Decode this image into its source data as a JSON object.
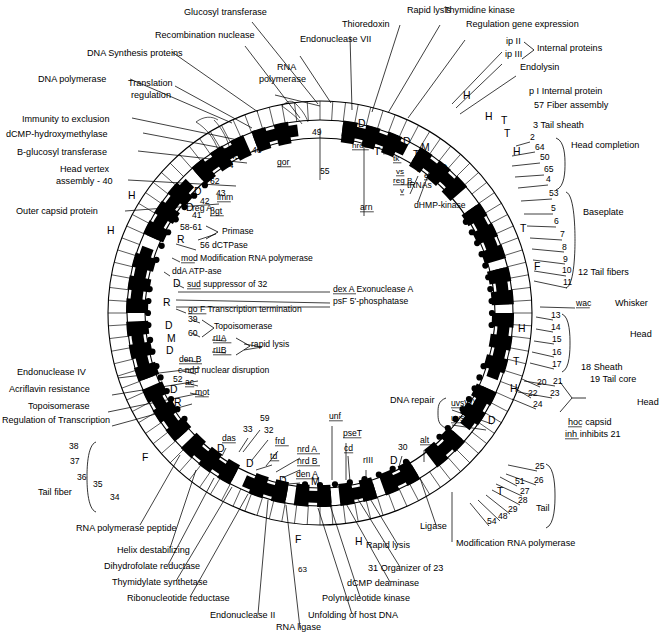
{
  "figure": {
    "type": "circular-genetic-map",
    "background": "#ffffff",
    "ink": "#000000"
  },
  "outer_labels_left": [
    {
      "text": "DNA polymerase",
      "x": 38,
      "y": 82
    },
    {
      "text": "Immunity to exclusion",
      "x": 22,
      "y": 122
    },
    {
      "text": "dCMP-hydroxymethylase",
      "x": 6,
      "y": 137
    },
    {
      "text": "B-glucosyl transferase",
      "x": 17,
      "y": 155
    },
    {
      "text": "Head vertex",
      "x": 60,
      "y": 172
    },
    {
      "text": "assembly - 40",
      "x": 56,
      "y": 184
    },
    {
      "text": "Outer capsid protein",
      "x": 16,
      "y": 214
    },
    {
      "text": "Endonuclease IV",
      "x": 17,
      "y": 375
    },
    {
      "text": "Acriflavin resistance",
      "x": 9,
      "y": 392
    },
    {
      "text": "Topoisomerase",
      "x": 28,
      "y": 409
    },
    {
      "text": "Regulation of Transcription",
      "x": 2,
      "y": 423
    },
    {
      "text": "Tail fiber",
      "x": 38,
      "y": 495
    },
    {
      "text": "RNA polymerase peptide",
      "x": 76,
      "y": 531
    },
    {
      "text": "Helix destabilizing",
      "x": 117,
      "y": 553
    },
    {
      "text": "Dihydrofolate reductase",
      "x": 104,
      "y": 569
    },
    {
      "text": "Thymidylate synthetase",
      "x": 112,
      "y": 585
    },
    {
      "text": "Ribonucleotide reductase",
      "x": 127,
      "y": 601
    },
    {
      "text": "Endonuclease II",
      "x": 210,
      "y": 618
    },
    {
      "text": "RNA ligase",
      "x": 276,
      "y": 630
    },
    {
      "text": "Unfolding of host DNA",
      "x": 308,
      "y": 618
    },
    {
      "text": "Polynucleotide kinase",
      "x": 322,
      "y": 601
    },
    {
      "text": "dCMP deaminase",
      "x": 347,
      "y": 586
    },
    {
      "text": "31 Organizer of 23",
      "x": 368,
      "y": 571
    },
    {
      "text": "Rapid lysis",
      "x": 366,
      "y": 548
    },
    {
      "text": "Ligase",
      "x": 420,
      "y": 529
    },
    {
      "text": "Modification RNA polymerase",
      "x": 456,
      "y": 546
    }
  ],
  "outer_labels_top": [
    {
      "text": "Translation",
      "x": 128,
      "y": 86
    },
    {
      "text": "regulation",
      "x": 131,
      "y": 98
    },
    {
      "text": "DNA  Synthesis  proteins",
      "x": 87,
      "y": 56
    },
    {
      "text": "Recombination nuclease",
      "x": 155,
      "y": 38
    },
    {
      "text": "Glucosyl transferase",
      "x": 184,
      "y": 15
    },
    {
      "text": "Endonuclease VII",
      "x": 300,
      "y": 42
    },
    {
      "text": "RNA",
      "x": 277,
      "y": 70
    },
    {
      "text": "polymerase",
      "x": 259,
      "y": 82
    },
    {
      "text": "Thioredoxin",
      "x": 342,
      "y": 27
    },
    {
      "text": "Rapid lysis",
      "x": 407,
      "y": 13
    },
    {
      "text": "Thymidine kinase",
      "x": 444,
      "y": 13
    },
    {
      "text": "Regulation gene expression",
      "x": 466,
      "y": 27
    },
    {
      "text": "ip II",
      "x": 506,
      "y": 44
    },
    {
      "text": "ip III",
      "x": 505,
      "y": 57
    },
    {
      "text": "Internal proteins",
      "x": 537,
      "y": 51
    },
    {
      "text": "Endolysin",
      "x": 520,
      "y": 70
    },
    {
      "text": "p I   Internal protein",
      "x": 529,
      "y": 94
    },
    {
      "text": "57  Fiber assembly",
      "x": 534,
      "y": 108
    },
    {
      "text": "3  Tail sheath",
      "x": 533,
      "y": 128
    },
    {
      "text": "Head completion",
      "x": 571,
      "y": 148
    },
    {
      "text": "Baseplate",
      "x": 583,
      "y": 215
    },
    {
      "text": "12  Tail fibers",
      "x": 578,
      "y": 275
    },
    {
      "text": "Whisker",
      "x": 615,
      "y": 306
    },
    {
      "text": "Head",
      "x": 630,
      "y": 337
    },
    {
      "text": "18 Sheath",
      "x": 581,
      "y": 370
    },
    {
      "text": "19 Tail core",
      "x": 590,
      "y": 382
    },
    {
      "text": "Head",
      "x": 637,
      "y": 405
    },
    {
      "text": "hoc   capsid",
      "x": 568,
      "y": 425
    },
    {
      "text": "inh   inhibits 21",
      "x": 565,
      "y": 437
    },
    {
      "text": "Tail",
      "x": 536,
      "y": 511
    },
    {
      "text": "DNA repair",
      "x": 390,
      "y": 403
    }
  ],
  "inner_labels": [
    {
      "text": "reg A",
      "x": 192,
      "y": 211
    },
    {
      "text": "gor",
      "x": 277,
      "y": 165
    },
    {
      "text": "55",
      "x": 320,
      "y": 174
    },
    {
      "text": "arn",
      "x": 360,
      "y": 210
    },
    {
      "text": "dHMP-kinase",
      "x": 414,
      "y": 208
    },
    {
      "text": "tRNAs",
      "x": 407,
      "y": 188
    },
    {
      "text": "49",
      "x": 312,
      "y": 135
    },
    {
      "text": "46",
      "x": 252,
      "y": 153
    },
    {
      "text": "45",
      "x": 230,
      "y": 159
    },
    {
      "text": "44",
      "x": 224,
      "y": 168
    },
    {
      "text": "62",
      "x": 210,
      "y": 184
    },
    {
      "text": "43",
      "x": 216,
      "y": 196
    },
    {
      "text": "42",
      "x": 200,
      "y": 204
    },
    {
      "text": "41",
      "x": 192,
      "y": 218
    },
    {
      "text": "58-61",
      "x": 180,
      "y": 230
    },
    {
      "text": "imm",
      "x": 217,
      "y": 200
    },
    {
      "text": "βgt",
      "x": 210,
      "y": 214
    },
    {
      "text": "Primase",
      "x": 222,
      "y": 234
    },
    {
      "text": "56 dCTPase",
      "x": 200,
      "y": 248
    },
    {
      "text": "mod Modification RNA polymerase",
      "x": 181,
      "y": 261
    },
    {
      "text": "ddA ATP-ase",
      "x": 172,
      "y": 274
    },
    {
      "text": "sud  suppressor of 32",
      "x": 187,
      "y": 287
    },
    {
      "text": "dex A  Exonuclease A",
      "x": 333,
      "y": 292
    },
    {
      "text": "psF 5'-phosphatase",
      "x": 333,
      "y": 304
    },
    {
      "text": "go F Transcription termination",
      "x": 188,
      "y": 312
    },
    {
      "text": "39",
      "x": 188,
      "y": 322
    },
    {
      "text": "60",
      "x": 188,
      "y": 336
    },
    {
      "text": "Topoisomerase",
      "x": 214,
      "y": 329
    },
    {
      "text": "rIIA",
      "x": 213,
      "y": 341
    },
    {
      "text": "rIIB",
      "x": 213,
      "y": 353
    },
    {
      "text": "rapid lysis",
      "x": 251,
      "y": 347
    },
    {
      "text": "den B",
      "x": 179,
      "y": 362
    },
    {
      "text": "c  ndd  nuclear disruption",
      "x": 178,
      "y": 373
    },
    {
      "text": "ac",
      "x": 185,
      "y": 385
    },
    {
      "text": "52",
      "x": 173,
      "y": 382
    },
    {
      "text": "mot",
      "x": 195,
      "y": 395
    },
    {
      "text": "uvsW)",
      "x": 451,
      "y": 406
    },
    {
      "text": "uvsY)",
      "x": 451,
      "y": 421
    },
    {
      "text": "59",
      "x": 260,
      "y": 421
    },
    {
      "text": "33",
      "x": 243,
      "y": 432
    },
    {
      "text": "32",
      "x": 264,
      "y": 433
    },
    {
      "text": "das",
      "x": 222,
      "y": 441
    },
    {
      "text": "frd",
      "x": 275,
      "y": 444
    },
    {
      "text": "td",
      "x": 270,
      "y": 459
    },
    {
      "text": "nrd A",
      "x": 297,
      "y": 452
    },
    {
      "text": "nrd B",
      "x": 297,
      "y": 464
    },
    {
      "text": "den A",
      "x": 296,
      "y": 477
    },
    {
      "text": "unf",
      "x": 329,
      "y": 419
    },
    {
      "text": "pseT",
      "x": 343,
      "y": 436
    },
    {
      "text": "cd",
      "x": 344,
      "y": 451
    },
    {
      "text": "rIII",
      "x": 363,
      "y": 463
    },
    {
      "text": "30",
      "x": 398,
      "y": 450
    },
    {
      "text": "alt",
      "x": 420,
      "y": 443
    },
    {
      "text": "38",
      "x": 69,
      "y": 449
    },
    {
      "text": "37",
      "x": 70,
      "y": 464
    },
    {
      "text": "36",
      "x": 77,
      "y": 480
    },
    {
      "text": "35",
      "x": 93,
      "y": 487
    },
    {
      "text": "34",
      "x": 110,
      "y": 500
    },
    {
      "text": "2",
      "x": 530,
      "y": 140
    },
    {
      "text": "64",
      "x": 535,
      "y": 150
    },
    {
      "text": "50",
      "x": 540,
      "y": 160
    },
    {
      "text": "65",
      "x": 544,
      "y": 172
    },
    {
      "text": "4",
      "x": 546,
      "y": 182
    },
    {
      "text": "53",
      "x": 549,
      "y": 196
    },
    {
      "text": "5",
      "x": 551,
      "y": 211
    },
    {
      "text": "6",
      "x": 554,
      "y": 224
    },
    {
      "text": "7",
      "x": 560,
      "y": 237
    },
    {
      "text": "8",
      "x": 562,
      "y": 250
    },
    {
      "text": "9",
      "x": 563,
      "y": 262
    },
    {
      "text": "10",
      "x": 562,
      "y": 273
    },
    {
      "text": "11",
      "x": 563,
      "y": 285
    },
    {
      "text": "wac",
      "x": 576,
      "y": 306
    },
    {
      "text": "13",
      "x": 551,
      "y": 318
    },
    {
      "text": "14",
      "x": 551,
      "y": 330
    },
    {
      "text": "15",
      "x": 552,
      "y": 342
    },
    {
      "text": "16",
      "x": 552,
      "y": 355
    },
    {
      "text": "17",
      "x": 552,
      "y": 367
    },
    {
      "text": "20",
      "x": 537,
      "y": 385
    },
    {
      "text": "21",
      "x": 553,
      "y": 384
    },
    {
      "text": "22",
      "x": 528,
      "y": 396
    },
    {
      "text": "23",
      "x": 550,
      "y": 396
    },
    {
      "text": "24",
      "x": 533,
      "y": 407
    },
    {
      "text": "25",
      "x": 535,
      "y": 469
    },
    {
      "text": "26",
      "x": 534,
      "y": 483
    },
    {
      "text": "51",
      "x": 515,
      "y": 484
    },
    {
      "text": "27",
      "x": 520,
      "y": 494
    },
    {
      "text": "28",
      "x": 518,
      "y": 503
    },
    {
      "text": "29",
      "x": 508,
      "y": 512
    },
    {
      "text": "48",
      "x": 498,
      "y": 519
    },
    {
      "text": "54",
      "x": 487,
      "y": 524
    }
  ],
  "gene_letters": [
    {
      "text": "H",
      "x": 128,
      "y": 199
    },
    {
      "text": "H",
      "x": 107,
      "y": 234
    },
    {
      "text": "D",
      "x": 218,
      "y": 160
    },
    {
      "text": "T",
      "x": 208,
      "y": 181
    },
    {
      "text": "D",
      "x": 194,
      "y": 195
    },
    {
      "text": "D",
      "x": 186,
      "y": 211
    },
    {
      "text": "R",
      "x": 177,
      "y": 243
    },
    {
      "text": "D",
      "x": 173,
      "y": 287
    },
    {
      "text": "R",
      "x": 163,
      "y": 306
    },
    {
      "text": "D",
      "x": 165,
      "y": 329
    },
    {
      "text": "M",
      "x": 167,
      "y": 342
    },
    {
      "text": "D",
      "x": 166,
      "y": 354
    },
    {
      "text": "D",
      "x": 170,
      "y": 393
    },
    {
      "text": "R",
      "x": 174,
      "y": 406
    },
    {
      "text": "F",
      "x": 142,
      "y": 461
    },
    {
      "text": "D",
      "x": 217,
      "y": 452
    },
    {
      "text": "D",
      "x": 246,
      "y": 467
    },
    {
      "text": "D",
      "x": 279,
      "y": 484
    },
    {
      "text": "M",
      "x": 311,
      "y": 485
    },
    {
      "text": "D",
      "x": 390,
      "y": 464
    },
    {
      "text": "R",
      "x": 432,
      "y": 459
    },
    {
      "text": "F",
      "x": 295,
      "y": 543
    },
    {
      "text": "H",
      "x": 355,
      "y": 545
    },
    {
      "text": "63",
      "x": 298,
      "y": 572
    },
    {
      "text": "R",
      "x": 270,
      "y": 140
    },
    {
      "text": "D",
      "x": 358,
      "y": 127
    },
    {
      "text": "M",
      "x": 390,
      "y": 143
    },
    {
      "text": "D",
      "x": 403,
      "y": 145
    },
    {
      "text": "T",
      "x": 374,
      "y": 155
    },
    {
      "text": "T",
      "x": 413,
      "y": 158
    },
    {
      "text": "M",
      "x": 421,
      "y": 151
    },
    {
      "text": "T",
      "x": 415,
      "y": 172
    },
    {
      "text": "D",
      "x": 440,
      "y": 172
    },
    {
      "text": "H",
      "x": 463,
      "y": 99
    },
    {
      "text": "H",
      "x": 485,
      "y": 120
    },
    {
      "text": "T",
      "x": 501,
      "y": 124
    },
    {
      "text": "T",
      "x": 504,
      "y": 137
    },
    {
      "text": "H",
      "x": 513,
      "y": 155
    },
    {
      "text": "T",
      "x": 520,
      "y": 232
    },
    {
      "text": "F",
      "x": 534,
      "y": 270
    },
    {
      "text": "H",
      "x": 518,
      "y": 332
    },
    {
      "text": "T",
      "x": 513,
      "y": 365
    },
    {
      "text": "H",
      "x": 510,
      "y": 392
    },
    {
      "text": "D",
      "x": 488,
      "y": 424
    },
    {
      "text": "T",
      "x": 497,
      "y": 495
    },
    {
      "text": "nrdC",
      "x": 352,
      "y": 148
    },
    {
      "text": "rl",
      "x": 383,
      "y": 152
    },
    {
      "text": "tk",
      "x": 393,
      "y": 161
    },
    {
      "text": "vs",
      "x": 396,
      "y": 174
    },
    {
      "text": "reg B",
      "x": 393,
      "y": 183
    },
    {
      "text": "v",
      "x": 400,
      "y": 193
    },
    {
      "text": "e",
      "x": 424,
      "y": 178
    },
    {
      "text": "αgt",
      "x": 258,
      "y": 144
    }
  ],
  "ring": {
    "center_x": 320,
    "center_y": 313,
    "outer_radius": 212,
    "tick_radius": 193,
    "band_outer": 190,
    "band_inner": 178,
    "inner_radius": 175,
    "segment_count": 104,
    "black_runs": [
      [
        2,
        7
      ],
      [
        9,
        13
      ],
      [
        16,
        20
      ],
      [
        22,
        24
      ],
      [
        26,
        31
      ],
      [
        33,
        36
      ],
      [
        38,
        40
      ],
      [
        43,
        45
      ],
      [
        47,
        49
      ],
      [
        51,
        53
      ],
      [
        55,
        58
      ],
      [
        60,
        64
      ],
      [
        66,
        70
      ],
      [
        72,
        76
      ],
      [
        78,
        83
      ],
      [
        85,
        90
      ],
      [
        92,
        96
      ],
      [
        98,
        101
      ]
    ]
  },
  "markers": {
    "note": "filled circles marking gene positions along inner edge of ring",
    "count": 44
  }
}
